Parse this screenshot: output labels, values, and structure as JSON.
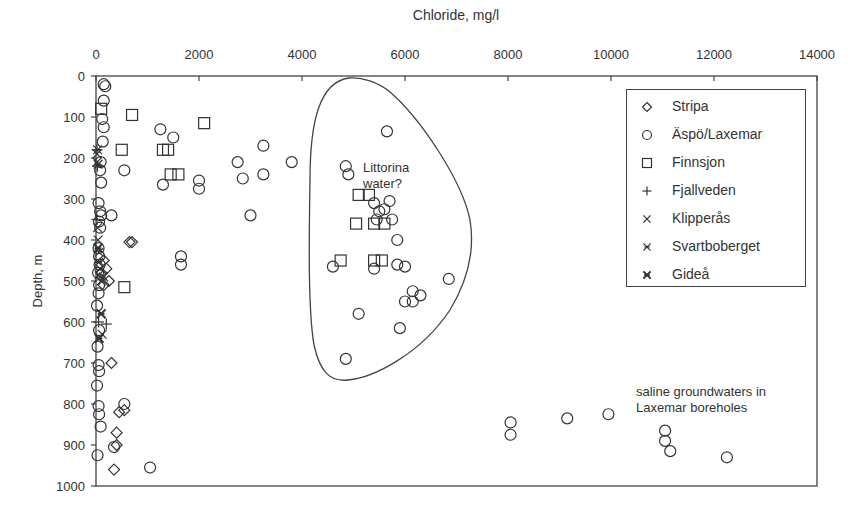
{
  "chart_data": {
    "type": "scatter",
    "title": "",
    "xlabel": "Chloride, mg/l",
    "ylabel": "Depth, m",
    "xlim": [
      0,
      14000
    ],
    "ylim": [
      0,
      1000
    ],
    "y_inverted": true,
    "x_axis_position": "top",
    "x_ticks": [
      "0",
      "2000",
      "4000",
      "6000",
      "8000",
      "10000",
      "12000",
      "14000"
    ],
    "y_ticks": [
      "0",
      "100",
      "200",
      "300",
      "400",
      "500",
      "600",
      "700",
      "800",
      "900",
      "1000"
    ],
    "grid": false,
    "legend_position": "upper right (inside)",
    "series": [
      {
        "name": "Stripa",
        "marker": "diamond",
        "points": [
          [
            650,
            405
          ],
          [
            700,
            405
          ],
          [
            150,
            450
          ],
          [
            200,
            470
          ],
          [
            100,
            480
          ],
          [
            250,
            500
          ],
          [
            150,
            510
          ],
          [
            300,
            700
          ],
          [
            550,
            815
          ],
          [
            450,
            820
          ],
          [
            400,
            870
          ],
          [
            400,
            900
          ],
          [
            350,
            960
          ]
        ]
      },
      {
        "name": "Äspö/Laxemar",
        "marker": "circle",
        "points": [
          [
            150,
            20
          ],
          [
            180,
            25
          ],
          [
            150,
            60
          ],
          [
            120,
            105
          ],
          [
            150,
            125
          ],
          [
            130,
            160
          ],
          [
            90,
            210
          ],
          [
            80,
            230
          ],
          [
            100,
            260
          ],
          [
            50,
            310
          ],
          [
            80,
            330
          ],
          [
            100,
            340
          ],
          [
            300,
            340
          ],
          [
            60,
            355
          ],
          [
            80,
            370
          ],
          [
            50,
            420
          ],
          [
            60,
            440
          ],
          [
            70,
            460
          ],
          [
            40,
            480
          ],
          [
            60,
            510
          ],
          [
            50,
            530
          ],
          [
            20,
            560
          ],
          [
            60,
            620
          ],
          [
            30,
            660
          ],
          [
            50,
            705
          ],
          [
            60,
            720
          ],
          [
            20,
            755
          ],
          [
            50,
            805
          ],
          [
            60,
            825
          ],
          [
            90,
            855
          ],
          [
            350,
            905
          ],
          [
            30,
            925
          ],
          [
            1250,
            130
          ],
          [
            1500,
            150
          ],
          [
            1300,
            265
          ],
          [
            550,
            230
          ],
          [
            2000,
            255
          ],
          [
            2000,
            275
          ],
          [
            1650,
            440
          ],
          [
            1650,
            460
          ],
          [
            2750,
            210
          ],
          [
            2850,
            250
          ],
          [
            3250,
            170
          ],
          [
            3800,
            210
          ],
          [
            3250,
            240
          ],
          [
            3000,
            340
          ],
          [
            5650,
            135
          ],
          [
            4850,
            220
          ],
          [
            4900,
            240
          ],
          [
            5400,
            310
          ],
          [
            5500,
            330
          ],
          [
            5700,
            305
          ],
          [
            5600,
            325
          ],
          [
            5450,
            350
          ],
          [
            5750,
            350
          ],
          [
            5850,
            400
          ],
          [
            4600,
            465
          ],
          [
            5400,
            470
          ],
          [
            5850,
            460
          ],
          [
            6000,
            465
          ],
          [
            6850,
            495
          ],
          [
            6150,
            525
          ],
          [
            6300,
            535
          ],
          [
            6000,
            550
          ],
          [
            6150,
            550
          ],
          [
            5100,
            580
          ],
          [
            5900,
            615
          ],
          [
            4850,
            690
          ],
          [
            550,
            800
          ],
          [
            1050,
            955
          ],
          [
            8050,
            845
          ],
          [
            8050,
            875
          ],
          [
            9150,
            835
          ],
          [
            9950,
            825
          ],
          [
            11050,
            865
          ],
          [
            11050,
            890
          ],
          [
            11150,
            915
          ],
          [
            12250,
            930
          ]
        ]
      },
      {
        "name": "Finnsjon",
        "marker": "square",
        "points": [
          [
            100,
            80
          ],
          [
            700,
            95
          ],
          [
            2100,
            115
          ],
          [
            500,
            180
          ],
          [
            1300,
            180
          ],
          [
            1400,
            180
          ],
          [
            1450,
            240
          ],
          [
            1600,
            240
          ],
          [
            5100,
            290
          ],
          [
            5300,
            290
          ],
          [
            5050,
            360
          ],
          [
            5400,
            360
          ],
          [
            5600,
            360
          ],
          [
            4750,
            450
          ],
          [
            5400,
            450
          ],
          [
            5550,
            450
          ],
          [
            550,
            515
          ]
        ]
      },
      {
        "name": "Fjallveden",
        "marker": "plus",
        "points": [
          [
            20,
            180
          ],
          [
            30,
            220
          ],
          [
            20,
            350
          ],
          [
            50,
            600
          ],
          [
            200,
            605
          ]
        ]
      },
      {
        "name": "Klipperås",
        "marker": "x",
        "points": [
          [
            20,
            190
          ],
          [
            20,
            210
          ],
          [
            30,
            370
          ],
          [
            40,
            400
          ],
          [
            60,
            430
          ],
          [
            80,
            470
          ],
          [
            150,
            490
          ],
          [
            100,
            500
          ],
          [
            120,
            630
          ]
        ]
      },
      {
        "name": "Svartboberget",
        "marker": "asterisk",
        "points": [
          [
            30,
            180
          ],
          [
            40,
            215
          ],
          [
            50,
            455
          ],
          [
            60,
            485
          ]
        ]
      },
      {
        "name": "Gideå",
        "marker": "asterisk-bold",
        "points": [
          [
            40,
            420
          ],
          [
            100,
            580
          ],
          [
            60,
            640
          ]
        ]
      }
    ],
    "annotations": [
      {
        "text": "Littorina water?",
        "x": 5300,
        "y": 215
      },
      {
        "text": "saline groundwaters in Laxemar boreholes",
        "x": 10500,
        "y": 820
      }
    ],
    "shapes": [
      {
        "type": "closed-curve",
        "label": "Littorina water envelope",
        "approx_bounds": {
          "x": [
            4400,
            7000
          ],
          "y": [
            80,
            780
          ]
        }
      }
    ]
  },
  "legend": {
    "items": [
      {
        "label": "Stripa",
        "marker": "diamond"
      },
      {
        "label": "Äspö/Laxemar",
        "marker": "circle"
      },
      {
        "label": "Finnsjon",
        "marker": "square"
      },
      {
        "label": "Fjallveden",
        "marker": "plus"
      },
      {
        "label": "Klipperås",
        "marker": "x"
      },
      {
        "label": "Svartboberget",
        "marker": "asterisk"
      },
      {
        "label": "Gideå",
        "marker": "asterisk-bold"
      }
    ]
  },
  "annotations": {
    "littorina_line1": "Littorina",
    "littorina_line2": "water?",
    "saline_line1": "saline groundwaters in",
    "saline_line2": "Laxemar boreholes"
  },
  "colors": {
    "ink": "#333333",
    "axis": "#444444",
    "background": "#ffffff"
  }
}
